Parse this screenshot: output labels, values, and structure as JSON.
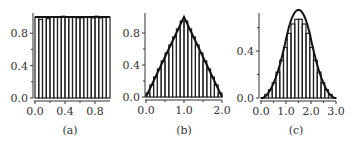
{
  "chart_data": [
    {
      "type": "bar",
      "caption": "(a)",
      "title": "",
      "xlabel": "",
      "ylabel": "",
      "xlim": [
        0.0,
        1.0
      ],
      "ylim": [
        0.0,
        1.0
      ],
      "xticks": [
        "0.0",
        "0.4",
        "0.8"
      ],
      "yticks": [
        "0.0",
        "0.4",
        "0.8"
      ],
      "bin_width": 0.05,
      "x": [
        0.025,
        0.075,
        0.125,
        0.175,
        0.225,
        0.275,
        0.325,
        0.375,
        0.425,
        0.475,
        0.525,
        0.575,
        0.625,
        0.675,
        0.725,
        0.775,
        0.825,
        0.875,
        0.925,
        0.975
      ],
      "values": [
        1.0,
        0.97,
        1.0,
        0.98,
        1.0,
        1.0,
        1.0,
        1.01,
        1.0,
        1.0,
        1.0,
        0.99,
        0.99,
        1.0,
        1.0,
        0.99,
        1.01,
        0.99,
        1.0,
        1.0
      ],
      "curve": "uniform density = 1"
    },
    {
      "type": "bar",
      "caption": "(b)",
      "title": "",
      "xlabel": "",
      "ylabel": "",
      "xlim": [
        0.0,
        2.0
      ],
      "ylim": [
        0.0,
        1.0
      ],
      "xticks": [
        "0.0",
        "1.0",
        "2.0"
      ],
      "yticks": [
        "0.0",
        "0.4",
        "0.8"
      ],
      "bin_width": 0.1,
      "x": [
        0.05,
        0.15,
        0.25,
        0.35,
        0.45,
        0.55,
        0.65,
        0.75,
        0.85,
        0.95,
        1.05,
        1.15,
        1.25,
        1.35,
        1.45,
        1.55,
        1.65,
        1.75,
        1.85,
        1.95
      ],
      "values": [
        0.05,
        0.15,
        0.25,
        0.35,
        0.45,
        0.55,
        0.65,
        0.75,
        0.85,
        0.95,
        0.95,
        0.85,
        0.75,
        0.65,
        0.55,
        0.45,
        0.35,
        0.25,
        0.15,
        0.05
      ],
      "curve": "triangular density, peak 1.0 at x=1.0"
    },
    {
      "type": "bar",
      "caption": "(c)",
      "title": "",
      "xlabel": "",
      "ylabel": "",
      "xlim": [
        0.0,
        3.0
      ],
      "ylim": [
        0.0,
        0.75
      ],
      "xticks": [
        "0.0",
        "1.0",
        "2.0",
        "3.0"
      ],
      "yticks": [
        "0.0",
        "0.4"
      ],
      "bin_width": 0.15,
      "x": [
        0.075,
        0.225,
        0.375,
        0.525,
        0.675,
        0.825,
        0.975,
        1.125,
        1.275,
        1.425,
        1.575,
        1.725,
        1.875,
        2.025,
        2.175,
        2.325,
        2.475,
        2.625,
        2.775,
        2.925
      ],
      "values": [
        0.003,
        0.03,
        0.07,
        0.13,
        0.22,
        0.32,
        0.43,
        0.55,
        0.63,
        0.67,
        0.67,
        0.63,
        0.55,
        0.43,
        0.32,
        0.22,
        0.13,
        0.07,
        0.03,
        0.003
      ],
      "curve": "bell-shaped density (sum of three uniforms), peak ~0.75 at x=1.5"
    }
  ],
  "panels": [
    {
      "caption": "(a)"
    },
    {
      "caption": "(b)"
    },
    {
      "caption": "(c)"
    }
  ]
}
